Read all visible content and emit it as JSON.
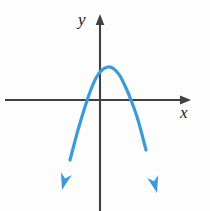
{
  "figure": {
    "background_color": "#fdfdfd",
    "axis_color": "#404040",
    "curve_color": "#3d9ad8"
  },
  "axes": {
    "x_label": "x",
    "y_label": "y",
    "x_axis_name": "x-axis",
    "y_axis_name": "y-axis",
    "x_axis_y_pixel": 100,
    "y_axis_x_pixel": 100,
    "x_axis_start_pixel": 5,
    "x_axis_end_pixel": 191,
    "y_axis_top_pixel": 15,
    "y_axis_bottom_pixel": 211,
    "arrow_heads": [
      "x-positive",
      "y-positive"
    ],
    "ticks": [],
    "tick_labels": []
  },
  "chart_data": {
    "type": "line",
    "title": "",
    "subtitle": "",
    "xlabel": "x",
    "ylabel": "y",
    "grid": false,
    "legend": null,
    "legend_position": "none",
    "series": [
      {
        "name": "parabola",
        "shape": "downward-opening parabola",
        "color": "#3d9ad8",
        "stroke_width": 3.2,
        "arrow_ends": [
          "left-end",
          "right-end"
        ],
        "vertex_pixel": [
          108,
          67
        ],
        "x_intercepts_pixel": [
          84,
          134
        ],
        "left_arrow_tip_pixel": [
          62,
          190
        ],
        "right_arrow_tip_pixel": [
          157,
          193
        ],
        "points_pixel": [
          [
            62,
            190
          ],
          [
            70,
            160
          ],
          [
            78,
            130
          ],
          [
            84,
            110
          ],
          [
            90,
            92
          ],
          [
            96,
            78
          ],
          [
            102,
            70
          ],
          [
            108,
            67
          ],
          [
            114,
            69
          ],
          [
            120,
            76
          ],
          [
            126,
            88
          ],
          [
            131,
            100
          ],
          [
            138,
            120
          ],
          [
            146,
            150
          ],
          [
            157,
            193
          ]
        ],
        "x_units": [
          -2.4,
          2.3
        ],
        "y_units": [
          -3.6,
          0.85
        ],
        "vertex_units": [
          0.2,
          0.85
        ],
        "roots_units": [
          -0.55,
          1.1
        ],
        "opens": "down"
      }
    ],
    "annotations": [
      {
        "text": "y",
        "position_pixel": [
          84,
          22
        ],
        "style": "italic-serif"
      },
      {
        "text": "x",
        "position_pixel": [
          185,
          115
        ],
        "style": "italic-serif"
      }
    ],
    "xlim": [
      -3.2,
      3.1
    ],
    "ylim": [
      -4.0,
      2.4
    ]
  }
}
